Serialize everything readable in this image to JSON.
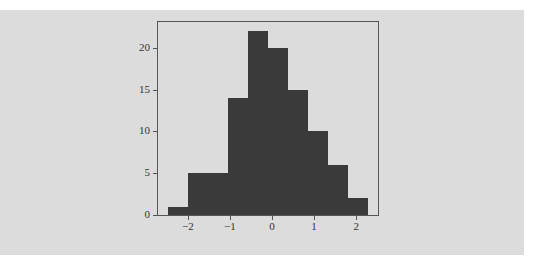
{
  "chart_data": {
    "type": "histogram",
    "title": "",
    "xlabel": "",
    "ylabel": "",
    "bin_edges": [
      -2.47,
      -1.995,
      -1.52,
      -1.045,
      -0.57,
      -0.095,
      0.38,
      0.855,
      1.33,
      1.805,
      2.28
    ],
    "counts": [
      1,
      5,
      5,
      14,
      22,
      20,
      15,
      10,
      6,
      2
    ],
    "xticks": [
      -2,
      -1,
      0,
      1,
      2
    ],
    "xtick_labels": [
      "−2",
      "−1",
      "0",
      "1",
      "2"
    ],
    "yticks": [
      0,
      5,
      10,
      15,
      20
    ],
    "ytick_labels": [
      "0",
      "5",
      "10",
      "15",
      "20"
    ],
    "xlim": [
      -2.71,
      2.52
    ],
    "ylim": [
      0,
      23.1
    ],
    "bar_color": "#3a3a3a",
    "background_color": "#dcdcdc",
    "grid": false,
    "legend": null
  }
}
